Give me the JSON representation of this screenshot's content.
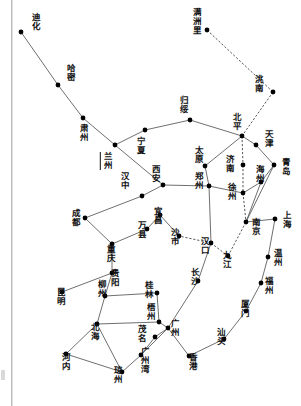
{
  "figure": {
    "type": "network-map",
    "title": "",
    "width": 301,
    "height": 406,
    "node_color": "#000000",
    "line_color": "#555555",
    "dashed_line_color": "#444444",
    "background": "#ffffff"
  },
  "legend": {
    "solid_meaning": "",
    "dashed_meaning": ""
  },
  "nodes": [
    {
      "id": "dihua",
      "label": "迪化",
      "x": 21,
      "y": 32,
      "lx": 30,
      "ly": 13,
      "orient": "h"
    },
    {
      "id": "hami",
      "label": "哈密",
      "x": 58,
      "y": 85,
      "lx": 65,
      "ly": 64,
      "orient": "h"
    },
    {
      "id": "suzhou",
      "label": "肃州",
      "x": 83,
      "y": 118,
      "lx": 78,
      "ly": 124,
      "orient": "h"
    },
    {
      "id": "lanzhou",
      "label": "兰州",
      "x": 115,
      "y": 145,
      "lx": 102,
      "ly": 152,
      "orient": "h",
      "underline": true
    },
    {
      "id": "ningxia",
      "label": "宁夏",
      "x": 145,
      "y": 130,
      "lx": 135,
      "ly": 137,
      "orient": "h"
    },
    {
      "id": "guisui",
      "label": "归绥",
      "x": 190,
      "y": 120,
      "lx": 178,
      "ly": 96,
      "orient": "h"
    },
    {
      "id": "manzhouli",
      "label": "满洲里",
      "x": 207,
      "y": 30,
      "lx": 191,
      "ly": 8,
      "orient": "h"
    },
    {
      "id": "taonan",
      "label": "洮南",
      "x": 273,
      "y": 92,
      "lx": 253,
      "ly": 75,
      "orient": "h"
    },
    {
      "id": "beiping",
      "label": "北平",
      "x": 242,
      "y": 136,
      "lx": 231,
      "ly": 113,
      "orient": "h"
    },
    {
      "id": "tianjin",
      "label": "天津",
      "x": 256,
      "y": 145,
      "lx": 263,
      "ly": 130,
      "orient": "h"
    },
    {
      "id": "taiyuan",
      "label": "太原",
      "x": 205,
      "y": 166,
      "lx": 193,
      "ly": 146,
      "orient": "h"
    },
    {
      "id": "qingdao",
      "label": "青岛",
      "x": 274,
      "y": 165,
      "lx": 280,
      "ly": 158,
      "orient": "h"
    },
    {
      "id": "jinan",
      "label": "济南",
      "x": 243,
      "y": 165,
      "lx": 224,
      "ly": 155,
      "orient": "h"
    },
    {
      "id": "haizhou",
      "label": "海州",
      "x": 261,
      "y": 182,
      "lx": 254,
      "ly": 165,
      "orient": "h"
    },
    {
      "id": "xuzhou",
      "label": "徐州",
      "x": 243,
      "y": 193,
      "lx": 226,
      "ly": 183,
      "orient": "h"
    },
    {
      "id": "zhengzhou",
      "label": "郑州",
      "x": 209,
      "y": 186,
      "lx": 193,
      "ly": 172,
      "orient": "h"
    },
    {
      "id": "xian",
      "label": "西安",
      "x": 163,
      "y": 185,
      "lx": 150,
      "ly": 165,
      "orient": "h"
    },
    {
      "id": "hanzhong",
      "label": "汉中",
      "x": 142,
      "y": 196,
      "lx": 119,
      "ly": 172,
      "orient": "h"
    },
    {
      "id": "chengdu",
      "label": "成都",
      "x": 85,
      "y": 218,
      "lx": 70,
      "ly": 209,
      "orient": "h"
    },
    {
      "id": "wanxian",
      "label": "万县",
      "x": 147,
      "y": 229,
      "lx": 136,
      "ly": 221,
      "orient": "h"
    },
    {
      "id": "yichang",
      "label": "宜昌",
      "x": 160,
      "y": 215,
      "lx": 152,
      "ly": 207,
      "orient": "h"
    },
    {
      "id": "shashi",
      "label": "沙市",
      "x": 179,
      "y": 236,
      "lx": 169,
      "ly": 228,
      "orient": "h"
    },
    {
      "id": "hankou",
      "label": "汉口",
      "x": 211,
      "y": 243,
      "lx": 199,
      "ly": 237,
      "orient": "h"
    },
    {
      "id": "nanjing",
      "label": "南京",
      "x": 246,
      "y": 222,
      "lx": 250,
      "ly": 218,
      "orient": "h"
    },
    {
      "id": "shanghai",
      "label": "上海",
      "x": 275,
      "y": 219,
      "lx": 281,
      "ly": 211,
      "orient": "h"
    },
    {
      "id": "jiujiang",
      "label": "九江",
      "x": 228,
      "y": 256,
      "lx": 221,
      "ly": 251,
      "orient": "h"
    },
    {
      "id": "chongqing",
      "label": "重庆",
      "x": 112,
      "y": 244,
      "lx": 105,
      "ly": 245,
      "orient": "h"
    },
    {
      "id": "guiyang",
      "label": "贵阳",
      "x": 112,
      "y": 273,
      "lx": 109,
      "ly": 269,
      "orient": "h"
    },
    {
      "id": "kunming",
      "label": "昆明",
      "x": 62,
      "y": 292,
      "lx": 55,
      "ly": 288,
      "orient": "h"
    },
    {
      "id": "liuzhou",
      "label": "柳州",
      "x": 105,
      "y": 296,
      "lx": 96,
      "ly": 280,
      "orient": "h"
    },
    {
      "id": "guilin",
      "label": "桂林",
      "x": 157,
      "y": 293,
      "lx": 143,
      "ly": 281,
      "orient": "h"
    },
    {
      "id": "wuzhou",
      "label": "梧州",
      "x": 159,
      "y": 322,
      "lx": 145,
      "ly": 303,
      "orient": "h"
    },
    {
      "id": "beihai",
      "label": "北海",
      "x": 97,
      "y": 324,
      "lx": 89,
      "ly": 323,
      "orient": "h"
    },
    {
      "id": "maoming",
      "label": "茂名",
      "x": 155,
      "y": 337,
      "lx": 136,
      "ly": 325,
      "orient": "h"
    },
    {
      "id": "hanoi",
      "label": "河内",
      "x": 66,
      "y": 354,
      "lx": 60,
      "ly": 353,
      "orient": "h"
    },
    {
      "id": "qiongzhou",
      "label": "琼州",
      "x": 122,
      "y": 372,
      "lx": 112,
      "ly": 366,
      "orient": "h"
    },
    {
      "id": "guangzhouwan",
      "label": "广州湾",
      "x": 141,
      "y": 355,
      "lx": 139,
      "ly": 347,
      "orient": "h"
    },
    {
      "id": "guangzhou",
      "label": "广州",
      "x": 168,
      "y": 328,
      "lx": 169,
      "ly": 319,
      "orient": "h"
    },
    {
      "id": "changsha",
      "label": "长沙",
      "x": 198,
      "y": 281,
      "lx": 189,
      "ly": 268,
      "orient": "h"
    },
    {
      "id": "hongkong",
      "label": "香港",
      "x": 189,
      "y": 356,
      "lx": 187,
      "ly": 353,
      "orient": "h"
    },
    {
      "id": "shantou",
      "label": "汕头",
      "x": 224,
      "y": 339,
      "lx": 215,
      "ly": 328,
      "orient": "h"
    },
    {
      "id": "xiamen",
      "label": "厦门",
      "x": 246,
      "y": 311,
      "lx": 239,
      "ly": 300,
      "orient": "h"
    },
    {
      "id": "fuzhou",
      "label": "福州",
      "x": 261,
      "y": 283,
      "lx": 263,
      "ly": 277,
      "orient": "h"
    },
    {
      "id": "wenzhou",
      "label": "温州",
      "x": 268,
      "y": 257,
      "lx": 272,
      "ly": 249,
      "orient": "h"
    }
  ],
  "edges": [
    {
      "from": "dihua",
      "to": "hami",
      "style": "solid"
    },
    {
      "from": "hami",
      "to": "suzhou",
      "style": "solid"
    },
    {
      "from": "suzhou",
      "to": "lanzhou",
      "style": "solid"
    },
    {
      "from": "lanzhou",
      "to": "ningxia",
      "style": "solid"
    },
    {
      "from": "ningxia",
      "to": "guisui",
      "style": "solid"
    },
    {
      "from": "guisui",
      "to": "beiping",
      "style": "solid"
    },
    {
      "from": "lanzhou",
      "to": "xian",
      "style": "solid"
    },
    {
      "from": "xian",
      "to": "hanzhong",
      "style": "solid"
    },
    {
      "from": "hanzhong",
      "to": "chengdu",
      "style": "solid"
    },
    {
      "from": "xian",
      "to": "zhengzhou",
      "style": "solid"
    },
    {
      "from": "zhengzhou",
      "to": "taiyuan",
      "style": "solid"
    },
    {
      "from": "taiyuan",
      "to": "beiping",
      "style": "solid"
    },
    {
      "from": "beiping",
      "to": "tianjin",
      "style": "solid"
    },
    {
      "from": "tianjin",
      "to": "qingdao",
      "style": "solid"
    },
    {
      "from": "qingdao",
      "to": "haizhou",
      "style": "solid"
    },
    {
      "from": "haizhou",
      "to": "nanjing",
      "style": "solid"
    },
    {
      "from": "qingdao",
      "to": "nanjing",
      "style": "solid"
    },
    {
      "from": "zhengzhou",
      "to": "xuzhou",
      "style": "solid"
    },
    {
      "from": "xuzhou",
      "to": "haizhou",
      "style": "solid"
    },
    {
      "from": "manzhouli",
      "to": "taonan",
      "style": "dashed"
    },
    {
      "from": "taonan",
      "to": "beiping",
      "style": "dashed"
    },
    {
      "from": "beiping",
      "to": "jinan",
      "style": "dashed"
    },
    {
      "from": "jinan",
      "to": "xuzhou",
      "style": "dashed"
    },
    {
      "from": "xuzhou",
      "to": "nanjing",
      "style": "dashed"
    },
    {
      "from": "nanjing",
      "to": "shanghai",
      "style": "solid"
    },
    {
      "from": "zhengzhou",
      "to": "hankou",
      "style": "solid"
    },
    {
      "from": "hankou",
      "to": "jiujiang",
      "style": "dashed"
    },
    {
      "from": "jiujiang",
      "to": "nanjing",
      "style": "dashed"
    },
    {
      "from": "hankou",
      "to": "shashi",
      "style": "dashed"
    },
    {
      "from": "shashi",
      "to": "yichang",
      "style": "solid"
    },
    {
      "from": "yichang",
      "to": "wanxian",
      "style": "solid"
    },
    {
      "from": "wanxian",
      "to": "chongqing",
      "style": "solid"
    },
    {
      "from": "chengdu",
      "to": "chongqing",
      "style": "solid"
    },
    {
      "from": "chongqing",
      "to": "guiyang",
      "style": "solid"
    },
    {
      "from": "guiyang",
      "to": "kunming",
      "style": "solid"
    },
    {
      "from": "guiyang",
      "to": "liuzhou",
      "style": "solid"
    },
    {
      "from": "liuzhou",
      "to": "guilin",
      "style": "solid"
    },
    {
      "from": "guilin",
      "to": "wuzhou",
      "style": "solid"
    },
    {
      "from": "liuzhou",
      "to": "beihai",
      "style": "solid"
    },
    {
      "from": "beihai",
      "to": "wuzhou",
      "style": "solid"
    },
    {
      "from": "wuzhou",
      "to": "guangzhou",
      "style": "solid"
    },
    {
      "from": "beihai",
      "to": "hanoi",
      "style": "solid"
    },
    {
      "from": "beihai",
      "to": "qiongzhou",
      "style": "solid"
    },
    {
      "from": "hanoi",
      "to": "qiongzhou",
      "style": "solid"
    },
    {
      "from": "qiongzhou",
      "to": "guangzhouwan",
      "style": "solid"
    },
    {
      "from": "guangzhouwan",
      "to": "guangzhou",
      "style": "solid"
    },
    {
      "from": "maoming",
      "to": "guangzhou",
      "style": "solid"
    },
    {
      "from": "guangzhouwan",
      "to": "maoming",
      "style": "solid"
    },
    {
      "from": "hankou",
      "to": "changsha",
      "style": "solid"
    },
    {
      "from": "changsha",
      "to": "guangzhou",
      "style": "solid"
    },
    {
      "from": "guangzhou",
      "to": "hongkong",
      "style": "solid"
    },
    {
      "from": "hongkong",
      "to": "shantou",
      "style": "solid"
    },
    {
      "from": "shantou",
      "to": "xiamen",
      "style": "solid"
    },
    {
      "from": "xiamen",
      "to": "fuzhou",
      "style": "solid"
    },
    {
      "from": "fuzhou",
      "to": "wenzhou",
      "style": "solid"
    },
    {
      "from": "wenzhou",
      "to": "shanghai",
      "style": "solid"
    }
  ]
}
